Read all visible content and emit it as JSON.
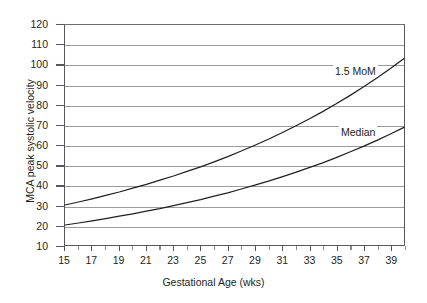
{
  "chart_data": {
    "type": "line",
    "title": "",
    "xlabel": "Gestational Age (wks)",
    "ylabel": "MCA peak systolic velocity",
    "xlim": [
      15,
      40
    ],
    "ylim": [
      10,
      120
    ],
    "xticks": [
      15,
      16,
      17,
      18,
      19,
      20,
      21,
      22,
      23,
      24,
      25,
      26,
      27,
      28,
      29,
      30,
      31,
      32,
      33,
      34,
      35,
      36,
      37,
      38,
      39,
      40
    ],
    "xtick_labels": [
      "15",
      "17",
      "19",
      "21",
      "23",
      "25",
      "27",
      "29",
      "31",
      "33",
      "35",
      "37",
      "39"
    ],
    "xtick_label_values": [
      15,
      17,
      19,
      21,
      23,
      25,
      27,
      29,
      31,
      33,
      35,
      37,
      39
    ],
    "yticks": [
      10,
      20,
      30,
      40,
      50,
      60,
      70,
      80,
      90,
      100,
      110,
      120
    ],
    "ytick_labels": [
      "10",
      "20",
      "30",
      "40",
      "50",
      "60",
      "70",
      "80",
      "90",
      "100",
      "110",
      "120"
    ],
    "grid": true,
    "grid_axis": "y",
    "legend": "inline-annotations",
    "x": [
      15,
      16,
      17,
      18,
      19,
      20,
      21,
      22,
      23,
      24,
      25,
      26,
      27,
      28,
      29,
      30,
      31,
      32,
      33,
      34,
      35,
      36,
      37,
      38,
      39,
      40
    ],
    "series": [
      {
        "name": "1.5 MoM",
        "color": "#231f20",
        "values": [
          30.0,
          31.5,
          33.1,
          34.8,
          36.5,
          38.4,
          40.3,
          42.4,
          44.5,
          46.8,
          49.1,
          51.6,
          54.2,
          57.0,
          59.9,
          62.9,
          66.1,
          69.5,
          73.0,
          76.7,
          80.6,
          84.7,
          89.0,
          93.5,
          98.2,
          103.2
        ]
      },
      {
        "name": "Median",
        "color": "#231f20",
        "values": [
          20.0,
          21.0,
          22.1,
          23.2,
          24.4,
          25.6,
          26.9,
          28.2,
          29.7,
          31.2,
          32.7,
          34.4,
          36.1,
          38.0,
          39.9,
          41.9,
          44.1,
          46.3,
          48.7,
          51.1,
          53.7,
          56.5,
          59.3,
          62.3,
          65.5,
          68.8
        ]
      }
    ],
    "annotations": [
      {
        "text": "1.5 MoM",
        "x": 33.5,
        "y": 94
      },
      {
        "text": "Median",
        "x": 34.0,
        "y": 63
      }
    ]
  }
}
